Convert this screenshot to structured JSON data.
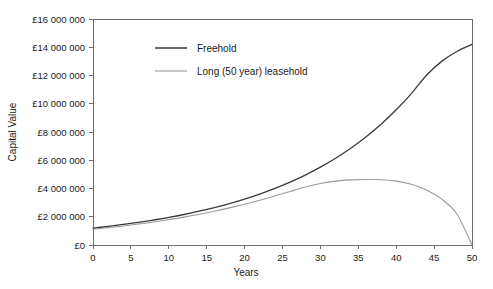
{
  "chart_data": {
    "type": "line",
    "title": "",
    "xlabel": "Years",
    "ylabel": "Capital Value",
    "xlim": [
      0,
      50
    ],
    "ylim": [
      0,
      16000000
    ],
    "grid": false,
    "legend_position": "upper-left-inside",
    "x_ticks": [
      0,
      5,
      10,
      15,
      20,
      25,
      30,
      35,
      40,
      45,
      50
    ],
    "x_tick_labels": [
      "0",
      "5",
      "10",
      "15",
      "20",
      "25",
      "30",
      "35",
      "40",
      "45",
      "50"
    ],
    "y_ticks": [
      0,
      2000000,
      4000000,
      6000000,
      8000000,
      10000000,
      12000000,
      14000000,
      16000000
    ],
    "y_tick_labels": [
      "£0",
      "£2 000 000",
      "£4 000 000",
      "£6 000 000",
      "£8 000 000",
      "£10 000 000",
      "£12 000 000",
      "£14 000 000",
      "£16 000 000"
    ],
    "series": [
      {
        "name": "Freehold",
        "color": "#3a3a3a",
        "width": 1.3,
        "x": [
          0,
          2,
          4,
          6,
          8,
          10,
          12,
          14,
          16,
          18,
          20,
          22,
          24,
          26,
          28,
          30,
          32,
          34,
          36,
          38,
          40,
          42,
          44,
          46,
          48,
          50
        ],
        "values": [
          1200000,
          1320000,
          1455000,
          1605000,
          1770000,
          1955000,
          2160000,
          2390000,
          2645000,
          2930000,
          3250000,
          3605000,
          4005000,
          4450000,
          4950000,
          5510000,
          6140000,
          6850000,
          7650000,
          8550000,
          9570000,
          10720000,
          12020000,
          13000000,
          13700000,
          14200000
        ]
      },
      {
        "name": "Long (50 year) leasehold",
        "color": "#9a9a9a",
        "width": 1.1,
        "x": [
          0,
          2,
          4,
          6,
          8,
          10,
          12,
          14,
          16,
          18,
          20,
          22,
          24,
          26,
          28,
          30,
          32,
          34,
          36,
          38,
          40,
          42,
          44,
          46,
          48,
          50
        ],
        "values": [
          1120000,
          1230000,
          1350000,
          1485000,
          1630000,
          1795000,
          1975000,
          2175000,
          2390000,
          2630000,
          2890000,
          3170000,
          3470000,
          3790000,
          4100000,
          4350000,
          4520000,
          4610000,
          4640000,
          4620000,
          4520000,
          4300000,
          3900000,
          3250000,
          2200000,
          0
        ]
      }
    ],
    "legend": [
      {
        "label": "Freehold",
        "color": "#3a3a3a",
        "width": 1.5
      },
      {
        "label": "Long (50 year) leasehold",
        "color": "#9a9a9a",
        "width": 1.1
      }
    ]
  }
}
